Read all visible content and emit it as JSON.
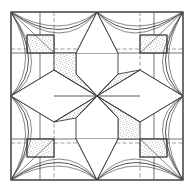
{
  "figure": {
    "type": "line-diagram",
    "canvas": {
      "width": 194,
      "height": 193
    },
    "colors": {
      "background": "#ffffff",
      "frame_stroke": "#4a4a4a",
      "line_stroke": "#3a3a3a",
      "grid_solid": "#5a5a5a",
      "grid_dashed": "#777777",
      "stipple_dot": "#555555",
      "stipple_field": "#ffffff"
    },
    "frame": {
      "x": 11,
      "y": 12,
      "width": 172,
      "height": 168
    },
    "center": {
      "x": 97,
      "y": 96
    },
    "grid": {
      "solid_vertical_x": [
        40,
        154
      ],
      "solid_horizontal_y": [
        53,
        139
      ],
      "dashed_vertical_x": [
        54,
        97,
        140
      ],
      "dashed_horizontal_y": [
        49,
        96,
        143
      ]
    },
    "rosette": {
      "sector_count": 8,
      "shaded_sectors": [
        1,
        3,
        5,
        7
      ],
      "description": "Eight kite sectors radiate from the centre, alternating stippled and plain"
    },
    "corner_squares": {
      "count": 4,
      "fill": "stipple",
      "positions": [
        "top-left",
        "top-right",
        "bottom-left",
        "bottom-right"
      ]
    },
    "cusps": {
      "count": 4,
      "nested_curves_per_cusp": 3,
      "description": "Concave arc bundles sweep from each frame corner toward the edge midpoints"
    }
  }
}
